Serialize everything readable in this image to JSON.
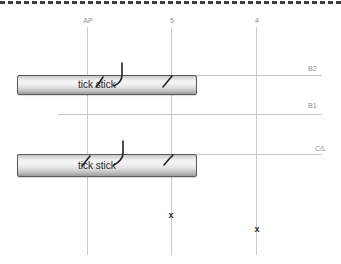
{
  "grid": {
    "vertical_lines": [
      {
        "label": "AP"
      },
      {
        "label": "5"
      },
      {
        "label": "4"
      }
    ],
    "horizontal_lines": [
      {
        "label": "B2"
      },
      {
        "label": "B1"
      },
      {
        "label": "C/L"
      }
    ]
  },
  "sticks": [
    {
      "label": "tick stick"
    },
    {
      "label": "tick stick"
    }
  ],
  "markers": [
    {
      "glyph": "x"
    },
    {
      "glyph": "x"
    }
  ],
  "colors": {
    "background": "#ffffff",
    "grid_line": "#cccccc",
    "label_gray": "#8f8f8f",
    "ink": "#222222",
    "dashed_border": "#3d3d3d",
    "stick_border": "#5a5a5a",
    "stick_light": "#f6f6f6",
    "stick_dark": "#9c9c9c"
  }
}
